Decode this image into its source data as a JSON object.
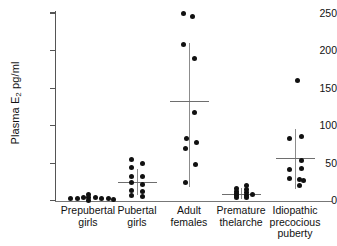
{
  "chart_data": {
    "type": "scatter",
    "title": "",
    "xlabel": "",
    "ylabel": "Plasma E2 pg/ml",
    "ylabel_prefix": "Plasma E",
    "ylabel_sub": "2",
    "ylabel_suffix": " pg/ml",
    "ylim": [
      0,
      250
    ],
    "yticks": [
      0,
      50,
      100,
      150,
      200,
      250
    ],
    "ytick_labels": [
      "0",
      "50",
      "100",
      "150",
      "200",
      "250"
    ],
    "grid": false,
    "legend": "none",
    "units": "pg/ml",
    "categories": [
      "Prepubertal girls",
      "Pubertal girls",
      "Adult females",
      "Premature thelarche",
      "Idiopathic precocious puberty"
    ],
    "groups": [
      {
        "name": "Prepubertal girls",
        "label_lines": [
          "Prepubertal",
          "girls"
        ],
        "center_x": 88,
        "mean": null,
        "sd_low": null,
        "sd_high": null,
        "has_mean_bar": false,
        "points": [
          {
            "x": 70,
            "value": 3
          },
          {
            "x": 77,
            "value": 3
          },
          {
            "x": 83,
            "value": 4
          },
          {
            "x": 88,
            "value": 9
          },
          {
            "x": 88,
            "value": 4
          },
          {
            "x": 88,
            "value": 1
          },
          {
            "x": 95,
            "value": 4
          },
          {
            "x": 101,
            "value": 3
          },
          {
            "x": 108,
            "value": 3
          },
          {
            "x": 113,
            "value": 2
          }
        ]
      },
      {
        "name": "Pubertal girls",
        "label_lines": [
          "Pubertal",
          "girls"
        ],
        "center_x": 137,
        "mean": 25,
        "sd_low": 8,
        "sd_high": 42,
        "has_mean_bar": true,
        "points": [
          {
            "x": 131,
            "value": 55
          },
          {
            "x": 142,
            "value": 50
          },
          {
            "x": 131,
            "value": 44
          },
          {
            "x": 131,
            "value": 33
          },
          {
            "x": 142,
            "value": 32
          },
          {
            "x": 131,
            "value": 25
          },
          {
            "x": 142,
            "value": 22
          },
          {
            "x": 131,
            "value": 14
          },
          {
            "x": 142,
            "value": 13
          },
          {
            "x": 131,
            "value": 7
          },
          {
            "x": 142,
            "value": 6
          }
        ]
      },
      {
        "name": "Adult females",
        "label_lines": [
          "Adult",
          "females"
        ],
        "center_x": 189,
        "mean": 133,
        "sd_low": 18,
        "sd_high": 210,
        "has_mean_bar": true,
        "points": [
          {
            "x": 183,
            "value": 250
          },
          {
            "x": 192,
            "value": 245
          },
          {
            "x": 183,
            "value": 208
          },
          {
            "x": 194,
            "value": 190
          },
          {
            "x": 194,
            "value": 118
          },
          {
            "x": 186,
            "value": 83
          },
          {
            "x": 196,
            "value": 77
          },
          {
            "x": 185,
            "value": 70
          },
          {
            "x": 195,
            "value": 48
          },
          {
            "x": 185,
            "value": 25
          }
        ]
      },
      {
        "name": "Premature thelarche",
        "label_lines": [
          "Premature",
          "thelarche"
        ],
        "center_x": 241,
        "mean": 9,
        "sd_low": 2,
        "sd_high": 17,
        "has_mean_bar": true,
        "points": [
          {
            "x": 236,
            "value": 17
          },
          {
            "x": 246,
            "value": 20
          },
          {
            "x": 236,
            "value": 13
          },
          {
            "x": 246,
            "value": 15
          },
          {
            "x": 236,
            "value": 10
          },
          {
            "x": 246,
            "value": 11
          },
          {
            "x": 236,
            "value": 7
          },
          {
            "x": 246,
            "value": 7
          },
          {
            "x": 236,
            "value": 4
          },
          {
            "x": 246,
            "value": 4
          },
          {
            "x": 252,
            "value": 9
          }
        ]
      },
      {
        "name": "Idiopathic precocious puberty",
        "label_lines": [
          "Idiopathic",
          "precocious",
          "puberty"
        ],
        "center_x": 295,
        "mean": 57,
        "sd_low": 16,
        "sd_high": 96,
        "has_mean_bar": true,
        "points": [
          {
            "x": 297,
            "value": 160
          },
          {
            "x": 289,
            "value": 83
          },
          {
            "x": 301,
            "value": 85
          },
          {
            "x": 301,
            "value": 53
          },
          {
            "x": 289,
            "value": 42
          },
          {
            "x": 301,
            "value": 43
          },
          {
            "x": 289,
            "value": 30
          },
          {
            "x": 299,
            "value": 28
          },
          {
            "x": 303,
            "value": 27
          },
          {
            "x": 299,
            "value": 20
          }
        ]
      }
    ]
  }
}
